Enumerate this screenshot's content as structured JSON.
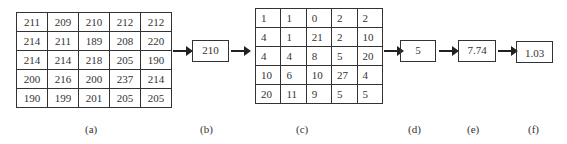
{
  "grid_a": {
    "rows": [
      [
        "211",
        "209",
        "210",
        "212",
        "212"
      ],
      [
        "214",
        "211",
        "189",
        "208",
        "220"
      ],
      [
        "214",
        "214",
        "218",
        "205",
        "190"
      ],
      [
        "200",
        "216",
        "200",
        "237",
        "214"
      ],
      [
        "190",
        "199",
        "201",
        "205",
        "205"
      ]
    ]
  },
  "box_b": {
    "value": "210"
  },
  "grid_c": {
    "rows": [
      [
        "1",
        "1",
        "0",
        "2",
        "2"
      ],
      [
        "4",
        "1",
        "21",
        "2",
        "10"
      ],
      [
        "4",
        "4",
        "8",
        "5",
        "20"
      ],
      [
        "10",
        "6",
        "10",
        "27",
        "4"
      ],
      [
        "20",
        "11",
        "9",
        "5",
        "5"
      ]
    ]
  },
  "box_d": {
    "value": "5"
  },
  "box_e": {
    "value": "7.74"
  },
  "box_f": {
    "value": "1.03"
  },
  "labels": {
    "a": "(a)",
    "b": "(b)",
    "c": "(c)",
    "d": "(d)",
    "e": "(e)",
    "f": "(f)"
  },
  "icons": {
    "arrow": "right-arrow-icon"
  },
  "colors": {
    "line": "#333333",
    "background": "#ffffff"
  }
}
